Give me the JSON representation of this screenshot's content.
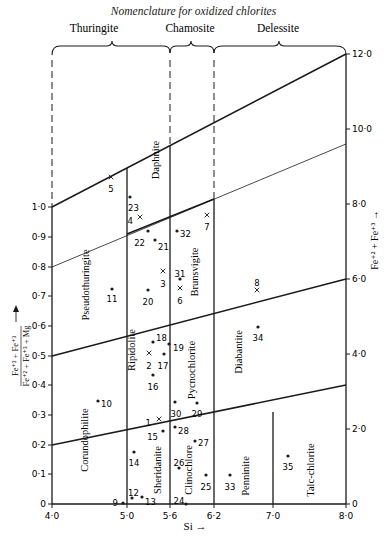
{
  "title": "Nomenclature for oxidized chlorites",
  "groups": [
    {
      "label": "Thuringite",
      "x": 94,
      "from": 52,
      "to": 170
    },
    {
      "label": "Chamosite",
      "x": 190,
      "from": 170,
      "to": 214
    },
    {
      "label": "Delessite",
      "x": 278,
      "from": 214,
      "to": 346
    }
  ],
  "axes": {
    "x_label": "Si →",
    "x_ticks": [
      {
        "label": "4·0",
        "x": 52
      },
      {
        "label": "5·0",
        "x": 127
      },
      {
        "label": "5·6",
        "x": 170
      },
      {
        "label": "6·2",
        "x": 214
      },
      {
        "label": "7·0",
        "x": 273
      },
      {
        "label": "8·0",
        "x": 346
      }
    ],
    "left_label_numerator": "Fe⁺² + Fe⁺³",
    "left_label_denominator": "Fe⁺² + Fe⁺³ + Mg",
    "left_ticks": [
      {
        "label": "1·0",
        "y": 207
      },
      {
        "label": "0·9",
        "y": 237
      },
      {
        "label": "0·8",
        "y": 267
      },
      {
        "label": "0·7",
        "y": 296
      },
      {
        "label": "0·6",
        "y": 326
      },
      {
        "label": "0·5",
        "y": 356
      },
      {
        "label": "0·4",
        "y": 385
      },
      {
        "label": "0·3",
        "y": 415
      },
      {
        "label": "0·2",
        "y": 445
      },
      {
        "label": "0·1",
        "y": 474
      },
      {
        "label": "0",
        "y": 504
      }
    ],
    "right_label": "Fe⁺² + Fe⁺³ →",
    "right_ticks": [
      {
        "label": "12·0",
        "y": 54
      },
      {
        "label": "10·0",
        "y": 129
      },
      {
        "label": "8·0",
        "y": 204
      },
      {
        "label": "6·0",
        "y": 279
      },
      {
        "label": "4·0",
        "y": 354
      },
      {
        "label": "2·0",
        "y": 429
      },
      {
        "label": "0",
        "y": 504
      }
    ]
  },
  "fields": [
    {
      "name": "Pseudothuringite",
      "x": 89,
      "y": 285
    },
    {
      "name": "Daphnite",
      "x": 159,
      "y": 160
    },
    {
      "name": "Brunsvigite",
      "x": 198,
      "y": 272
    },
    {
      "name": "Ripidolite",
      "x": 135,
      "y": 350
    },
    {
      "name": "Pycnochlorite",
      "x": 195,
      "y": 370
    },
    {
      "name": "Diabantite",
      "x": 242,
      "y": 352
    },
    {
      "name": "Corundophilite",
      "x": 88,
      "y": 440
    },
    {
      "name": "Sheridanite",
      "x": 161,
      "y": 470
    },
    {
      "name": "Clinochlore",
      "x": 192,
      "y": 470
    },
    {
      "name": "Penninite",
      "x": 249,
      "y": 476
    },
    {
      "name": "Talc-chlorite",
      "x": 314,
      "y": 470
    }
  ],
  "chart_data": {
    "type": "scatter",
    "title": "Nomenclature for oxidized chlorites",
    "xlabel": "Si",
    "ylabel": "(Fe+2 + Fe+3) / (Fe+2 + Fe+3 + Mg)",
    "y2label": "Fe+2 + Fe+3",
    "xlim": [
      4.0,
      8.0
    ],
    "ylim": [
      0,
      1.0
    ],
    "y2lim": [
      0,
      12.0
    ],
    "points": [
      {
        "id": "1",
        "marker": "x",
        "si": 5.5,
        "ratio": 0.28
      },
      {
        "id": "2",
        "marker": "x",
        "si": 5.3,
        "ratio": 0.51
      },
      {
        "id": "3",
        "marker": "x",
        "si": 5.5,
        "ratio": 0.77
      },
      {
        "id": "4",
        "marker": "x",
        "si": 5.2,
        "ratio": 0.95
      },
      {
        "id": "5",
        "marker": "x",
        "si": 4.8,
        "ratio": 1.09
      },
      {
        "id": "6",
        "marker": "x",
        "si": 5.7,
        "ratio": 0.72
      },
      {
        "id": "7",
        "marker": "x",
        "si": 6.1,
        "ratio": 0.96
      },
      {
        "id": "8",
        "marker": "x",
        "si": 6.8,
        "ratio": 0.69
      },
      {
        "id": "9",
        "marker": "dot",
        "si": 5.0,
        "ratio": 0.0
      },
      {
        "id": "10",
        "marker": "dot",
        "si": 4.6,
        "ratio": 0.35
      },
      {
        "id": "11",
        "marker": "dot",
        "si": 4.7,
        "ratio": 0.72
      },
      {
        "id": "12",
        "marker": "dot",
        "si": 5.1,
        "ratio": 0.02
      },
      {
        "id": "13",
        "marker": "dot",
        "si": 5.2,
        "ratio": 0.03
      },
      {
        "id": "14",
        "marker": "dot",
        "si": 5.1,
        "ratio": 0.17
      },
      {
        "id": "15",
        "marker": "dot",
        "si": 5.5,
        "ratio": 0.26
      },
      {
        "id": "16",
        "marker": "dot",
        "si": 5.4,
        "ratio": 0.44
      },
      {
        "id": "17",
        "marker": "dot",
        "si": 5.5,
        "ratio": 0.51
      },
      {
        "id": "18",
        "marker": "dot",
        "si": 5.4,
        "ratio": 0.54
      },
      {
        "id": "19",
        "marker": "dot",
        "si": 5.6,
        "ratio": 0.54
      },
      {
        "id": "20",
        "marker": "dot",
        "si": 5.4,
        "ratio": 0.72
      },
      {
        "id": "21",
        "marker": "dot",
        "si": 5.5,
        "ratio": 0.89
      },
      {
        "id": "22",
        "marker": "dot",
        "si": 5.4,
        "ratio": 0.92
      },
      {
        "id": "23",
        "marker": "dot",
        "si": 5.2,
        "ratio": 1.03
      },
      {
        "id": "24",
        "marker": "dot",
        "si": 5.7,
        "ratio": 0.0
      },
      {
        "id": "25",
        "marker": "dot",
        "si": 6.1,
        "ratio": 0.1
      },
      {
        "id": "26",
        "marker": "dot",
        "si": 5.8,
        "ratio": 0.13
      },
      {
        "id": "27",
        "marker": "dot",
        "si": 5.9,
        "ratio": 0.21
      },
      {
        "id": "28",
        "marker": "dot",
        "si": 5.7,
        "ratio": 0.26
      },
      {
        "id": "29",
        "marker": "dot",
        "si": 5.9,
        "ratio": 0.35
      },
      {
        "id": "30",
        "marker": "dot",
        "si": 5.7,
        "ratio": 0.35
      },
      {
        "id": "31",
        "marker": "dot",
        "si": 5.7,
        "ratio": 0.76
      },
      {
        "id": "32",
        "marker": "dot",
        "si": 5.7,
        "ratio": 0.92
      },
      {
        "id": "33",
        "marker": "dot",
        "si": 6.3,
        "ratio": 0.1
      },
      {
        "id": "34",
        "marker": "dot",
        "si": 6.9,
        "ratio": 0.58
      },
      {
        "id": "35",
        "marker": "dot",
        "si": 7.2,
        "ratio": 0.17
      }
    ]
  },
  "points_px": [
    {
      "id": "1",
      "m": "x",
      "x": 159,
      "y": 419,
      "lx": 151,
      "ly": 423,
      "anchor": "end"
    },
    {
      "id": "2",
      "m": "x",
      "x": 149,
      "y": 353,
      "lx": 149,
      "ly": 366,
      "anchor": "middle"
    },
    {
      "id": "3",
      "m": "x",
      "x": 163,
      "y": 271,
      "lx": 163,
      "ly": 284,
      "anchor": "middle"
    },
    {
      "id": "4",
      "m": "x",
      "x": 140,
      "y": 217,
      "lx": 133,
      "ly": 221,
      "anchor": "end"
    },
    {
      "id": "5",
      "m": "x",
      "x": 111,
      "y": 177,
      "lx": 111,
      "ly": 189,
      "anchor": "middle"
    },
    {
      "id": "6",
      "m": "x",
      "x": 180,
      "y": 288,
      "lx": 180,
      "ly": 301,
      "anchor": "middle"
    },
    {
      "id": "7",
      "m": "x",
      "x": 207,
      "y": 215,
      "lx": 207,
      "ly": 227,
      "anchor": "middle"
    },
    {
      "id": "8",
      "m": "x",
      "x": 257,
      "y": 290,
      "lx": 257,
      "ly": 283,
      "anchor": "middle"
    },
    {
      "id": "9",
      "m": "dot",
      "x": 123,
      "y": 503,
      "lx": 118,
      "ly": 503,
      "anchor": "end"
    },
    {
      "id": "10",
      "m": "dot",
      "x": 98,
      "y": 401,
      "lx": 101,
      "ly": 404,
      "anchor": "start"
    },
    {
      "id": "11",
      "m": "dot",
      "x": 112,
      "y": 289,
      "lx": 112,
      "ly": 299,
      "anchor": "middle"
    },
    {
      "id": "12",
      "m": "dot",
      "x": 132,
      "y": 498,
      "lx": 128,
      "ly": 493,
      "anchor": "start"
    },
    {
      "id": "13",
      "m": "dot",
      "x": 142,
      "y": 497,
      "lx": 145,
      "ly": 502,
      "anchor": "start"
    },
    {
      "id": "14",
      "m": "dot",
      "x": 134,
      "y": 452,
      "lx": 134,
      "ly": 463,
      "anchor": "middle"
    },
    {
      "id": "15",
      "m": "dot",
      "x": 163,
      "y": 431,
      "lx": 158,
      "ly": 437,
      "anchor": "end"
    },
    {
      "id": "16",
      "m": "dot",
      "x": 153,
      "y": 375,
      "lx": 153,
      "ly": 387,
      "anchor": "middle"
    },
    {
      "id": "17",
      "m": "dot",
      "x": 164,
      "y": 354,
      "lx": 163,
      "ly": 366,
      "anchor": "middle"
    },
    {
      "id": "18",
      "m": "dot",
      "x": 153,
      "y": 342,
      "lx": 156,
      "ly": 338,
      "anchor": "start"
    },
    {
      "id": "19",
      "m": "dot",
      "x": 169,
      "y": 344,
      "lx": 173,
      "ly": 348,
      "anchor": "start"
    },
    {
      "id": "20",
      "m": "dot",
      "x": 148,
      "y": 290,
      "lx": 148,
      "ly": 302,
      "anchor": "middle"
    },
    {
      "id": "21",
      "m": "dot",
      "x": 155,
      "y": 240,
      "lx": 158,
      "ly": 247,
      "anchor": "start"
    },
    {
      "id": "22",
      "m": "dot",
      "x": 148,
      "y": 231,
      "lx": 145,
      "ly": 243,
      "anchor": "end"
    },
    {
      "id": "23",
      "m": "dot",
      "x": 130,
      "y": 197,
      "lx": 128,
      "ly": 208,
      "anchor": "start"
    },
    {
      "id": "24",
      "m": "dot",
      "x": 186,
      "y": 504,
      "lx": 179,
      "ly": 501,
      "anchor": "middle"
    },
    {
      "id": "25",
      "m": "dot",
      "x": 206,
      "y": 475,
      "lx": 206,
      "ly": 487,
      "anchor": "middle"
    },
    {
      "id": "26",
      "m": "dot",
      "x": 179,
      "y": 468,
      "lx": 179,
      "ly": 463,
      "anchor": "middle"
    },
    {
      "id": "27",
      "m": "dot",
      "x": 195,
      "y": 441,
      "lx": 198,
      "ly": 443,
      "anchor": "start"
    },
    {
      "id": "28",
      "m": "dot",
      "x": 175,
      "y": 427,
      "lx": 178,
      "ly": 431,
      "anchor": "start"
    },
    {
      "id": "29",
      "m": "dot",
      "x": 197,
      "y": 403,
      "lx": 197,
      "ly": 414,
      "anchor": "middle"
    },
    {
      "id": "30",
      "m": "dot",
      "x": 175,
      "y": 402,
      "lx": 176,
      "ly": 414,
      "anchor": "middle"
    },
    {
      "id": "31",
      "m": "dot",
      "x": 180,
      "y": 279,
      "lx": 180,
      "ly": 274,
      "anchor": "middle"
    },
    {
      "id": "32",
      "m": "dot",
      "x": 177,
      "y": 231,
      "lx": 180,
      "ly": 234,
      "anchor": "start"
    },
    {
      "id": "33",
      "m": "dot",
      "x": 230,
      "y": 475,
      "lx": 230,
      "ly": 487,
      "anchor": "middle"
    },
    {
      "id": "34",
      "m": "dot",
      "x": 258,
      "y": 327,
      "lx": 258,
      "ly": 338,
      "anchor": "middle"
    },
    {
      "id": "35",
      "m": "dot",
      "x": 288,
      "y": 456,
      "lx": 288,
      "ly": 467,
      "anchor": "middle"
    }
  ]
}
